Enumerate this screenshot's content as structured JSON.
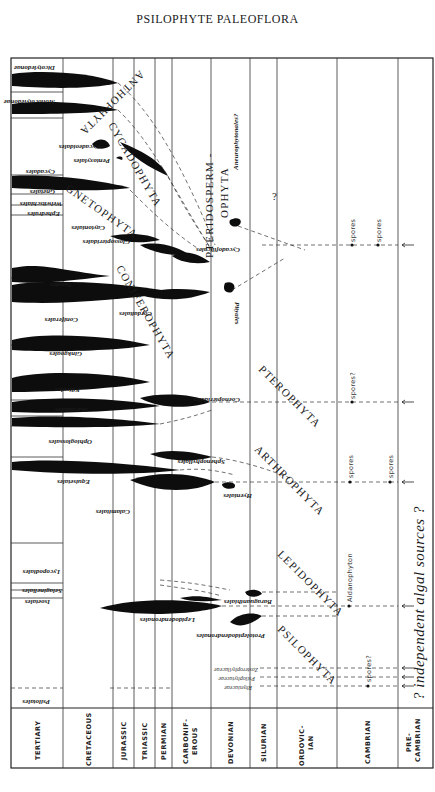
{
  "page": {
    "title": "PSILOPHYTE PALEOFLORA",
    "caption": "Fig. 1. Geologic history of plant groups"
  },
  "periods": [
    {
      "label": "TERTIARY",
      "x0": 11,
      "x1": 63
    },
    {
      "label": "CRETACEOUS",
      "x0": 63,
      "x1": 113
    },
    {
      "label": "JURASSIC",
      "x0": 113,
      "x1": 134
    },
    {
      "label": "TRIASSIC",
      "x0": 134,
      "x1": 155
    },
    {
      "label": "PERMIAN",
      "x0": 155,
      "x1": 172
    },
    {
      "label": "CARBONIF-",
      "label2": "EROUS",
      "x0": 172,
      "x1": 211
    },
    {
      "label": "DEVONIAN",
      "x0": 211,
      "x1": 250
    },
    {
      "label": "SILURIAN",
      "x0": 250,
      "x1": 277
    },
    {
      "label": "ORDOVIC-",
      "label2": "IAN",
      "x0": 277,
      "x1": 337
    },
    {
      "label": "CAMBRIAN",
      "x0": 337,
      "x1": 398
    },
    {
      "label": "PRE-",
      "label2": "CAMBRIAN",
      "x0": 398,
      "x1": 433
    }
  ],
  "taxa": [
    {
      "name": "Dicotyledonae",
      "y": 66
    },
    {
      "name": "Monocotyledonae",
      "y": 100
    },
    {
      "name": "Cycadeoidales",
      "y": 145
    },
    {
      "name": "Pentoxylales",
      "y": 159
    },
    {
      "name": "Cycadales",
      "y": 169
    },
    {
      "name": "Gnetales",
      "y": 188
    },
    {
      "name": "Welwitschiales",
      "y": 200
    },
    {
      "name": "Ephedrales",
      "y": 210
    },
    {
      "name": "Caytoniales",
      "y": 225
    },
    {
      "name": "Glossopteridales",
      "y": 240
    },
    {
      "name": "Taxales",
      "y": 280
    },
    {
      "name": "Coniferales",
      "y": 320
    },
    {
      "name": "Cordaitales",
      "y": 308
    },
    {
      "name": "Ginkgoales",
      "y": 348
    },
    {
      "name": "Filicales",
      "y": 383
    },
    {
      "name": "Marattiales",
      "y": 408
    },
    {
      "name": "Ophioglossales",
      "y": 435
    },
    {
      "name": "Equisetales",
      "y": 477
    },
    {
      "name": "Calamitales",
      "y": 510
    },
    {
      "name": "Lycopodiales",
      "y": 568
    },
    {
      "name": "Selaginellales",
      "y": 590
    },
    {
      "name": "Isoetales",
      "y": 600
    },
    {
      "name": "Psilotales",
      "y": 697
    }
  ],
  "extinct_taxa": [
    {
      "name": "Cycadofilicales",
      "y": 245
    },
    {
      "name": "Pityales",
      "y": 300
    },
    {
      "name": "Aneurophytonales?",
      "y": 180
    },
    {
      "name": "Coenopteridales",
      "y": 393
    },
    {
      "name": "Sphenophyllales",
      "y": 450
    },
    {
      "name": "Hyeniales",
      "y": 515
    },
    {
      "name": "Baraguanthiales",
      "y": 592
    },
    {
      "name": "Lepidodendronales",
      "y": 618
    },
    {
      "name": "Protolepidodendronales",
      "y": 633
    },
    {
      "name": "Zosterophyllaceae",
      "y": 668
    },
    {
      "name": "Psilophytaceae",
      "y": 677
    },
    {
      "name": "Rhyniaceae",
      "y": 686
    }
  ],
  "phyla": [
    {
      "name": "ANTHOPHYTA"
    },
    {
      "name": "CYCADOPHYTA"
    },
    {
      "name": "GNETOPHYTA"
    },
    {
      "name": "CONIFEROPHYTA"
    },
    {
      "name": "PTERIDOSPERM -"
    },
    {
      "name": "OPHYTA"
    },
    {
      "name": "PTEROPHYTA"
    },
    {
      "name": "ARTHROPHYTA"
    },
    {
      "name": "LEPIDOPHYTA"
    },
    {
      "name": "PSILOPHYTA"
    }
  ],
  "annotations": {
    "spores": "spores",
    "spores_q": "spores?",
    "aldanophyton": "Aldanophyton",
    "question": "?",
    "algal_line": "? independent   algal   sources  ?"
  }
}
